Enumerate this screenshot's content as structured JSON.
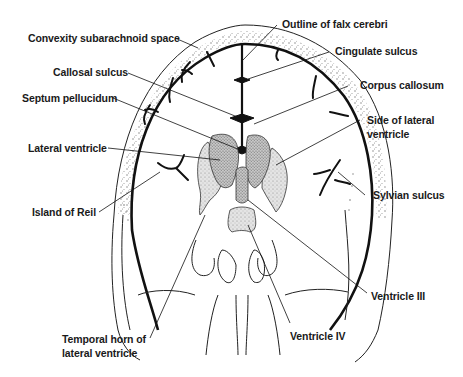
{
  "figure": {
    "labels": {
      "convexity_subarachnoid_space": "Convexity subarachnoid space",
      "callosal_sulcus": "Callosal sulcus",
      "septum_pellucidum": "Septum pellucidum",
      "lateral_ventricle": "Lateral ventricle",
      "island_of_reil": "Island of Reil",
      "temporal_horn_line1": "Temporal horn of",
      "temporal_horn_line2": "lateral ventricle",
      "outline_of_falx_cerebri": "Outline of falx cerebri",
      "cingulate_sulcus": "Cingulate sulcus",
      "corpus_callosum": "Corpus callosum",
      "side_of_lateral_ventricle_line1": "Side of lateral",
      "side_of_lateral_ventricle_line2": "ventricle",
      "sylvian_sulcus": "Sylvian sulcus",
      "ventricle_iii": "Ventricle III",
      "ventricle_iv": "Ventricle IV"
    },
    "colors": {
      "ink": "#111111",
      "stipple": "#8a8a8a",
      "ventricle_fill": "#d8d8d8",
      "background": "#ffffff"
    }
  }
}
